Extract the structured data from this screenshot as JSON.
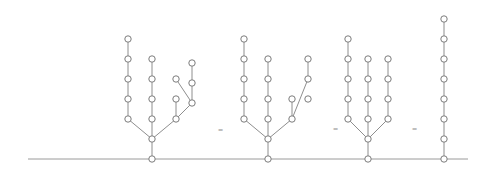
{
  "figure": {
    "width": 482,
    "height": 172,
    "background_color": "#ffffff",
    "node_color": "#ffffff",
    "node_stroke_color": "#7c7c7c",
    "edge_color": "#8e8e8e",
    "baseline_color": "#9a9a9a",
    "node_radius": 3.2,
    "baseline": {
      "y": 159,
      "x_start": 28,
      "x_end": 468
    }
  },
  "separators": [
    {
      "label": "=",
      "x": 221,
      "y": 131
    },
    {
      "label": "=",
      "x": 336,
      "y": 130
    },
    {
      "label": "=",
      "x": 415,
      "y": 130
    }
  ],
  "chart_data": {
    "type": "diagram",
    "baseline_y": 159,
    "trees": [
      {
        "name": "tree-1",
        "root": {
          "x": 152,
          "y": 159
        },
        "node_count": 17,
        "nodes": [
          {
            "id": "t1-n0",
            "x": 152,
            "y": 159
          },
          {
            "id": "t1-n1",
            "x": 152,
            "y": 139
          },
          {
            "id": "t1-n2",
            "x": 128,
            "y": 119
          },
          {
            "id": "t1-n3",
            "x": 128,
            "y": 99
          },
          {
            "id": "t1-n4",
            "x": 128,
            "y": 79
          },
          {
            "id": "t1-n5",
            "x": 128,
            "y": 59
          },
          {
            "id": "t1-n6",
            "x": 128,
            "y": 39
          },
          {
            "id": "t1-n7",
            "x": 152,
            "y": 119
          },
          {
            "id": "t1-n8",
            "x": 152,
            "y": 99
          },
          {
            "id": "t1-n9",
            "x": 152,
            "y": 79
          },
          {
            "id": "t1-n10",
            "x": 152,
            "y": 59
          },
          {
            "id": "t1-n11",
            "x": 176,
            "y": 119
          },
          {
            "id": "t1-n12",
            "x": 176,
            "y": 99
          },
          {
            "id": "t1-n13",
            "x": 192,
            "y": 103
          },
          {
            "id": "t1-n14",
            "x": 176,
            "y": 79
          },
          {
            "id": "t1-n15",
            "x": 192,
            "y": 83
          },
          {
            "id": "t1-n16",
            "x": 192,
            "y": 63
          }
        ],
        "edges": [
          [
            "t1-n0",
            "t1-n1"
          ],
          [
            "t1-n1",
            "t1-n2"
          ],
          [
            "t1-n2",
            "t1-n3"
          ],
          [
            "t1-n3",
            "t1-n4"
          ],
          [
            "t1-n4",
            "t1-n5"
          ],
          [
            "t1-n5",
            "t1-n6"
          ],
          [
            "t1-n1",
            "t1-n7"
          ],
          [
            "t1-n7",
            "t1-n8"
          ],
          [
            "t1-n8",
            "t1-n9"
          ],
          [
            "t1-n9",
            "t1-n10"
          ],
          [
            "t1-n1",
            "t1-n11"
          ],
          [
            "t1-n11",
            "t1-n12"
          ],
          [
            "t1-n11",
            "t1-n13"
          ],
          [
            "t1-n13",
            "t1-n14"
          ],
          [
            "t1-n13",
            "t1-n15"
          ],
          [
            "t1-n15",
            "t1-n16"
          ]
        ]
      },
      {
        "name": "tree-2",
        "root": {
          "x": 268,
          "y": 159
        },
        "node_count": 16,
        "nodes": [
          {
            "id": "t2-n0",
            "x": 268,
            "y": 159
          },
          {
            "id": "t2-n1",
            "x": 268,
            "y": 139
          },
          {
            "id": "t2-n2",
            "x": 244,
            "y": 119
          },
          {
            "id": "t2-n3",
            "x": 244,
            "y": 99
          },
          {
            "id": "t2-n4",
            "x": 244,
            "y": 79
          },
          {
            "id": "t2-n5",
            "x": 244,
            "y": 59
          },
          {
            "id": "t2-n6",
            "x": 244,
            "y": 39
          },
          {
            "id": "t2-n7",
            "x": 268,
            "y": 119
          },
          {
            "id": "t2-n8",
            "x": 268,
            "y": 99
          },
          {
            "id": "t2-n9",
            "x": 268,
            "y": 79
          },
          {
            "id": "t2-n10",
            "x": 268,
            "y": 59
          },
          {
            "id": "t2-n11",
            "x": 292,
            "y": 119
          },
          {
            "id": "t2-n12",
            "x": 292,
            "y": 99
          },
          {
            "id": "t2-n13",
            "x": 308,
            "y": 99
          },
          {
            "id": "t2-n14",
            "x": 308,
            "y": 79
          },
          {
            "id": "t2-n15",
            "x": 308,
            "y": 59
          }
        ],
        "edges": [
          [
            "t2-n0",
            "t2-n1"
          ],
          [
            "t2-n1",
            "t2-n2"
          ],
          [
            "t2-n2",
            "t2-n3"
          ],
          [
            "t2-n3",
            "t2-n4"
          ],
          [
            "t2-n4",
            "t2-n5"
          ],
          [
            "t2-n5",
            "t2-n6"
          ],
          [
            "t2-n1",
            "t2-n7"
          ],
          [
            "t2-n7",
            "t2-n8"
          ],
          [
            "t2-n8",
            "t2-n9"
          ],
          [
            "t2-n9",
            "t2-n10"
          ],
          [
            "t2-n1",
            "t2-n11"
          ],
          [
            "t2-n11",
            "t2-n12"
          ],
          [
            "t2-n11",
            "t2-n14"
          ],
          [
            "t2-n14",
            "t2-n15"
          ]
        ]
      },
      {
        "name": "tree-3",
        "root": {
          "x": 368,
          "y": 159
        },
        "node_count": 15,
        "nodes": [
          {
            "id": "t3-n0",
            "x": 368,
            "y": 159
          },
          {
            "id": "t3-n1",
            "x": 368,
            "y": 139
          },
          {
            "id": "t3-n2",
            "x": 348,
            "y": 119
          },
          {
            "id": "t3-n3",
            "x": 348,
            "y": 99
          },
          {
            "id": "t3-n4",
            "x": 348,
            "y": 79
          },
          {
            "id": "t3-n5",
            "x": 348,
            "y": 59
          },
          {
            "id": "t3-n6",
            "x": 348,
            "y": 39
          },
          {
            "id": "t3-n7",
            "x": 368,
            "y": 119
          },
          {
            "id": "t3-n8",
            "x": 368,
            "y": 99
          },
          {
            "id": "t3-n9",
            "x": 368,
            "y": 79
          },
          {
            "id": "t3-n10",
            "x": 368,
            "y": 59
          },
          {
            "id": "t3-n11",
            "x": 388,
            "y": 119
          },
          {
            "id": "t3-n12",
            "x": 388,
            "y": 99
          },
          {
            "id": "t3-n13",
            "x": 388,
            "y": 79
          },
          {
            "id": "t3-n14",
            "x": 388,
            "y": 59
          }
        ],
        "edges": [
          [
            "t3-n0",
            "t3-n1"
          ],
          [
            "t3-n1",
            "t3-n2"
          ],
          [
            "t3-n2",
            "t3-n3"
          ],
          [
            "t3-n3",
            "t3-n4"
          ],
          [
            "t3-n4",
            "t3-n5"
          ],
          [
            "t3-n5",
            "t3-n6"
          ],
          [
            "t3-n1",
            "t3-n7"
          ],
          [
            "t3-n7",
            "t3-n8"
          ],
          [
            "t3-n8",
            "t3-n9"
          ],
          [
            "t3-n9",
            "t3-n10"
          ],
          [
            "t3-n1",
            "t3-n11"
          ],
          [
            "t3-n11",
            "t3-n12"
          ],
          [
            "t3-n12",
            "t3-n13"
          ],
          [
            "t3-n13",
            "t3-n14"
          ]
        ]
      },
      {
        "name": "tree-4",
        "root": {
          "x": 444,
          "y": 159
        },
        "node_count": 8,
        "nodes": [
          {
            "id": "t4-n0",
            "x": 444,
            "y": 159
          },
          {
            "id": "t4-n1",
            "x": 444,
            "y": 139
          },
          {
            "id": "t4-n2",
            "x": 444,
            "y": 119
          },
          {
            "id": "t4-n3",
            "x": 444,
            "y": 99
          },
          {
            "id": "t4-n4",
            "x": 444,
            "y": 79
          },
          {
            "id": "t4-n5",
            "x": 444,
            "y": 59
          },
          {
            "id": "t4-n6",
            "x": 444,
            "y": 39
          },
          {
            "id": "t4-n7",
            "x": 444,
            "y": 19
          }
        ],
        "edges": [
          [
            "t4-n0",
            "t4-n1"
          ],
          [
            "t4-n1",
            "t4-n2"
          ],
          [
            "t4-n2",
            "t4-n3"
          ],
          [
            "t4-n3",
            "t4-n4"
          ],
          [
            "t4-n4",
            "t4-n5"
          ],
          [
            "t4-n5",
            "t4-n6"
          ],
          [
            "t4-n6",
            "t4-n7"
          ]
        ]
      }
    ]
  }
}
